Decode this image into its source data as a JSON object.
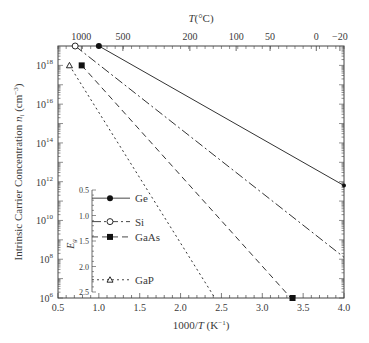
{
  "chart_data": {
    "type": "line",
    "title": "",
    "xlabel": "1000/T (K⁻¹)",
    "ylabel": "Intrinsic Carrier Concentration n_i (cm⁻³)",
    "top_xlabel": "T(°C)",
    "xlim": [
      0.5,
      4.0
    ],
    "ylim_log10": [
      6,
      19
    ],
    "yscale": "log",
    "grid": false,
    "x_ticks": [
      "0.5",
      "1.0",
      "1.5",
      "2.0",
      "2.5",
      "3.0",
      "3.5",
      "4.0"
    ],
    "y_ticks": [
      {
        "base": "10",
        "exp": "18",
        "log": 18
      },
      {
        "base": "10",
        "exp": "16",
        "log": 16
      },
      {
        "base": "10",
        "exp": "14",
        "log": 14
      },
      {
        "base": "10",
        "exp": "12",
        "log": 12
      },
      {
        "base": "10",
        "exp": "10",
        "log": 10
      },
      {
        "base": "10",
        "exp": "8",
        "log": 8
      },
      {
        "base": "10",
        "exp": "6",
        "log": 6
      }
    ],
    "top_ticks": [
      {
        "label": "1000",
        "x": 0.786
      },
      {
        "label": "500",
        "x": 1.294
      },
      {
        "label": "200",
        "x": 2.114
      },
      {
        "label": "100",
        "x": 2.68
      },
      {
        "label": "50",
        "x": 3.095
      },
      {
        "label": "0",
        "x": 3.661
      },
      {
        "label": "−20",
        "x": 3.95
      }
    ],
    "series": [
      {
        "name": "Ge",
        "style": "solid",
        "marker": "filled-circle",
        "points": [
          [
            1.0,
            19.0
          ],
          [
            4.0,
            11.8
          ]
        ]
      },
      {
        "name": "Si",
        "style": "dash-dot",
        "marker": "open-circle",
        "points": [
          [
            0.71,
            19.0
          ],
          [
            4.0,
            8.1
          ]
        ]
      },
      {
        "name": "GaAs",
        "style": "dashed",
        "marker": "filled-square",
        "points": [
          [
            0.79,
            18.0
          ],
          [
            3.35,
            6.0
          ]
        ]
      },
      {
        "name": "GaP",
        "style": "dotted",
        "marker": "open-triangle",
        "points": [
          [
            0.64,
            18.0
          ],
          [
            2.42,
            6.0
          ]
        ]
      }
    ],
    "inset": {
      "ylabel": "E_g",
      "y_ticks": [
        "0.5",
        "1.0",
        "1.5",
        "2.0",
        "2.5"
      ],
      "entries": [
        {
          "name": "Ge",
          "eg": 0.66
        },
        {
          "name": "Si",
          "eg": 1.12
        },
        {
          "name": "GaAs",
          "eg": 1.42
        },
        {
          "name": "GaP",
          "eg": 2.26
        }
      ]
    }
  }
}
